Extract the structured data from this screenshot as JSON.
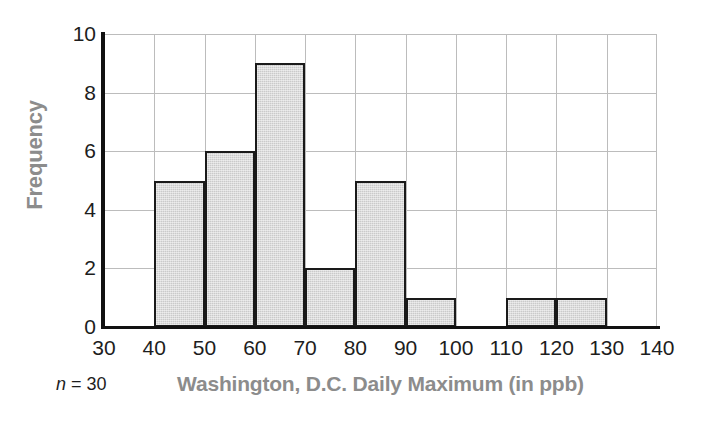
{
  "chart_data": {
    "type": "bar",
    "subtype": "histogram",
    "title": "",
    "xlabel": "Washington, D.C. Daily Maximum (in ppb)",
    "ylabel": "Frequency",
    "xlim": [
      30,
      140
    ],
    "ylim": [
      0,
      10
    ],
    "bin_width": 10,
    "xticks": [
      30,
      40,
      50,
      60,
      70,
      80,
      90,
      100,
      110,
      120,
      130,
      140
    ],
    "yticks": [
      0,
      2,
      4,
      6,
      8,
      10
    ],
    "grid": true,
    "legend": null,
    "bin_edges": [
      30,
      40,
      50,
      60,
      70,
      80,
      90,
      100,
      110,
      120,
      130,
      140
    ],
    "bins": [
      {
        "start": 30,
        "end": 40,
        "value": 0
      },
      {
        "start": 40,
        "end": 50,
        "value": 5
      },
      {
        "start": 50,
        "end": 60,
        "value": 6
      },
      {
        "start": 60,
        "end": 70,
        "value": 9
      },
      {
        "start": 70,
        "end": 80,
        "value": 2
      },
      {
        "start": 80,
        "end": 90,
        "value": 5
      },
      {
        "start": 90,
        "end": 100,
        "value": 1
      },
      {
        "start": 100,
        "end": 110,
        "value": 0
      },
      {
        "start": 110,
        "end": 120,
        "value": 1
      },
      {
        "start": 120,
        "end": 130,
        "value": 1
      },
      {
        "start": 130,
        "end": 140,
        "value": 0
      }
    ],
    "categories": [
      "30-40",
      "40-50",
      "50-60",
      "60-70",
      "70-80",
      "80-90",
      "90-100",
      "100-110",
      "110-120",
      "120-130",
      "130-140"
    ],
    "values": [
      0,
      5,
      6,
      9,
      2,
      5,
      1,
      0,
      1,
      1,
      0
    ],
    "annotations": [
      {
        "name": "sample-size",
        "text": "n = 30",
        "italic_part": "n",
        "rest": " = 30"
      }
    ],
    "colors": {
      "bar_fill": "#cacaca",
      "bar_edge": "#1a1a1a",
      "gridline": "#bcbcbc",
      "axis": "#111111",
      "axis_title": "#8c8c8c",
      "tick_label": "#1d1d1d",
      "background": "#ffffff"
    }
  },
  "footer": {
    "sample_size_prefix": "n",
    "sample_size_value": " = 30"
  }
}
